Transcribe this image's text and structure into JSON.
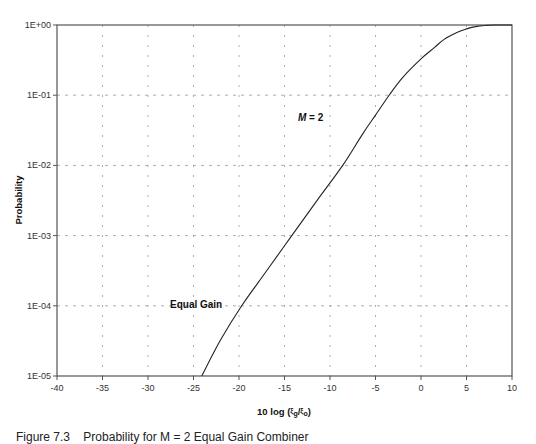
{
  "chart_data": {
    "type": "line",
    "title": "",
    "xlabel": "10 log (ξg/ξo)",
    "xlabel_parts": {
      "prefix": "10 log (",
      "num": "ξ",
      "num_sub": "g",
      "slash": "/",
      "den": "ξ",
      "den_sub": "o",
      "suffix": ")"
    },
    "ylabel": "Probability",
    "xlim": [
      -40,
      10
    ],
    "ylim": [
      1e-05,
      1
    ],
    "yscale": "log",
    "grid": true,
    "x_ticks": [
      -40,
      -35,
      -30,
      -25,
      -20,
      -15,
      -10,
      -5,
      0,
      5,
      10
    ],
    "x_tick_labels": [
      "-40",
      "-35",
      "-30",
      "-25",
      "-20",
      "-15",
      "-10",
      "-5",
      "0",
      "5",
      "10"
    ],
    "y_ticks": [
      1,
      0.1,
      0.01,
      0.001,
      0.0001,
      1e-05
    ],
    "y_tick_labels": [
      "1E+00",
      "1E-01",
      "1E-02",
      "1E-03",
      "1E-04",
      "1E-05"
    ],
    "series": [
      {
        "name": "Equal Gain",
        "x": [
          -24.1,
          -22,
          -19.7,
          -17,
          -14.2,
          -11.4,
          -8.6,
          -6.5,
          -5,
          -3.5,
          -2,
          0,
          1.5,
          2.5,
          4,
          5,
          6,
          7,
          8,
          10
        ],
        "y": [
          1e-05,
          3.3e-05,
          0.0001,
          0.00031,
          0.001,
          0.0032,
          0.01,
          0.027,
          0.052,
          0.1,
          0.18,
          0.33,
          0.48,
          0.62,
          0.79,
          0.88,
          0.95,
          0.985,
          1.0,
          1.0
        ]
      }
    ],
    "annotations": [
      {
        "text": "M = 2",
        "italic_part": "M",
        "rest": " = 2",
        "x": -17.2,
        "y": 0.1
      },
      {
        "text": "Equal Gain",
        "x": -29,
        "y": 0.0001
      }
    ],
    "legend": "none"
  },
  "caption": "Figure 7.3    Probability for M = 2 Equal Gain Combiner",
  "style": {
    "line_color": "#222222",
    "grid_color": "#999999",
    "axis_color": "#555555"
  }
}
